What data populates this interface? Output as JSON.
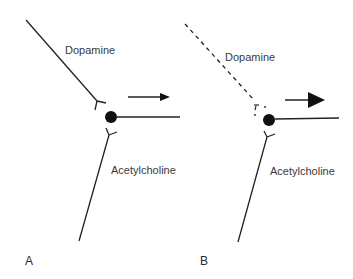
{
  "diagram": {
    "panels": [
      {
        "id": "A",
        "panel_label": "A",
        "dopamine_label": "Dopamine",
        "acetylcholine_label": "Acetylcholine",
        "dopamine_pathway": "solid",
        "arrow": "small"
      },
      {
        "id": "B",
        "panel_label": "B",
        "dopamine_label": "Dopamine",
        "acetylcholine_label": "Acetylcholine",
        "dopamine_pathway": "dashed",
        "arrow": "large"
      }
    ],
    "colors": {
      "line": "#222222",
      "text": "#3a3a3a",
      "background": "#ffffff"
    }
  }
}
